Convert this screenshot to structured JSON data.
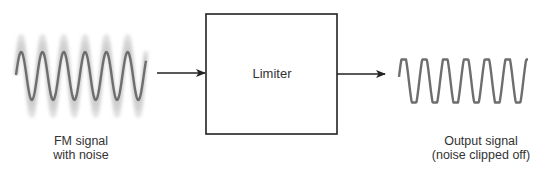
{
  "diagram": {
    "colors": {
      "stroke": "#222222",
      "wave": "#6e6e6e",
      "noise": "#c8c8c8",
      "text": "#333333",
      "background": "#ffffff"
    },
    "input": {
      "label_line1": "FM signal",
      "label_line2": "with noise",
      "wave": {
        "x_start": 16,
        "x_end": 146,
        "center_y": 76,
        "amplitude": 24,
        "period": 21.3,
        "phase_start_y": 75,
        "noise_amplitude": 39
      }
    },
    "block": {
      "label": "Limiter",
      "x": 206,
      "y": 14,
      "width": 131,
      "height": 120
    },
    "arrows": [
      {
        "x1": 157,
        "y1": 73,
        "x2": 205,
        "y2": 73
      },
      {
        "x1": 337,
        "y1": 74,
        "x2": 385,
        "y2": 74
      }
    ],
    "output": {
      "label_line1": "Output signal",
      "label_line2": "(noise clipped off)",
      "wave": {
        "x_start": 399,
        "x_end": 528,
        "center_y": 81,
        "amplitude": 28,
        "clip": 21.5,
        "period": 20.8
      }
    }
  }
}
